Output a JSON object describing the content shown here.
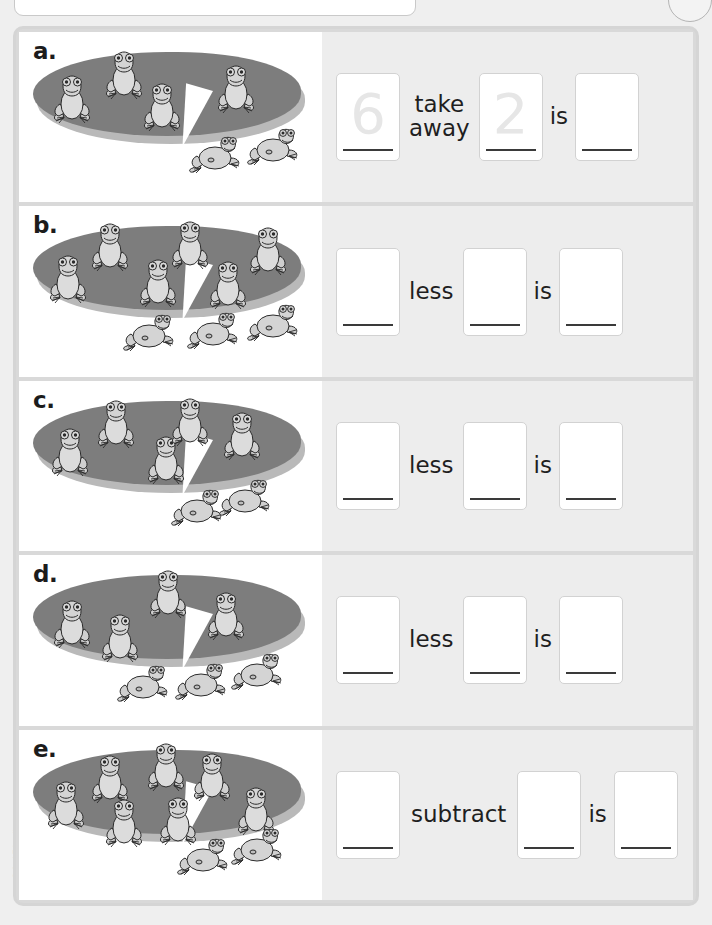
{
  "page": {
    "margin_credit": "Oxford Education",
    "top_panel": "",
    "divider_color": "#d5d5d5",
    "answer_panel_color": "#ededed",
    "pad_color": "#7d7d7d",
    "frog_color": "#d4d4d4"
  },
  "rows": [
    {
      "letter": "a.",
      "frogs_on_pad": 4,
      "frogs_hopping": 2,
      "box1": "6",
      "operator": "take\naway",
      "box2": "2",
      "equals": "is",
      "box3": ""
    },
    {
      "letter": "b.",
      "frogs_on_pad": 6,
      "frogs_hopping": 3,
      "box1": "",
      "operator": "less",
      "box2": "",
      "equals": "is",
      "box3": ""
    },
    {
      "letter": "c.",
      "frogs_on_pad": 5,
      "frogs_hopping": 2,
      "box1": "",
      "operator": "less",
      "box2": "",
      "equals": "is",
      "box3": ""
    },
    {
      "letter": "d.",
      "frogs_on_pad": 4,
      "frogs_hopping": 3,
      "box1": "",
      "operator": "less",
      "box2": "",
      "equals": "is",
      "box3": ""
    },
    {
      "letter": "e.",
      "frogs_on_pad": 7,
      "frogs_hopping": 2,
      "box1": "",
      "operator": "subtract",
      "box2": "",
      "equals": "is",
      "box3": ""
    }
  ],
  "layout": {
    "pad_positions": [
      [
        [
          22,
          34
        ],
        [
          74,
          10
        ],
        [
          112,
          42
        ],
        [
          186,
          24
        ]
      ],
      [
        [
          18,
          40
        ],
        [
          60,
          8
        ],
        [
          108,
          44
        ],
        [
          140,
          6
        ],
        [
          178,
          46
        ],
        [
          218,
          12
        ]
      ],
      [
        [
          20,
          38
        ],
        [
          66,
          10
        ],
        [
          116,
          46
        ],
        [
          140,
          8
        ],
        [
          192,
          22
        ]
      ],
      [
        [
          22,
          36
        ],
        [
          70,
          50
        ],
        [
          118,
          6
        ],
        [
          176,
          28
        ]
      ],
      [
        [
          16,
          42
        ],
        [
          60,
          16
        ],
        [
          74,
          60
        ],
        [
          116,
          4
        ],
        [
          128,
          58
        ],
        [
          162,
          14
        ],
        [
          206,
          48
        ]
      ]
    ],
    "hop_positions": [
      [
        [
          158,
          62
        ],
        [
          216,
          54
        ]
      ],
      [
        [
          92,
          66
        ],
        [
          156,
          64
        ],
        [
          216,
          56
        ]
      ],
      [
        [
          140,
          66
        ],
        [
          188,
          56
        ]
      ],
      [
        [
          86,
          68
        ],
        [
          144,
          66
        ],
        [
          200,
          56
        ]
      ],
      [
        [
          146,
          66
        ],
        [
          200,
          56
        ]
      ]
    ]
  }
}
